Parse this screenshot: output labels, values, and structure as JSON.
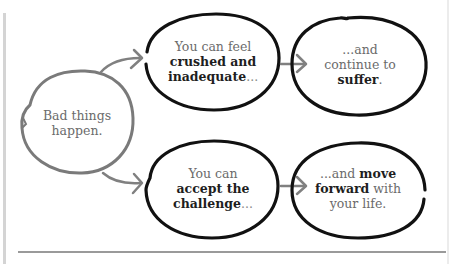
{
  "diagram": {
    "colors": {
      "start_stroke": "#7a7a7a",
      "node_stroke": "#111111",
      "arrow": "#808080",
      "rule": "#9a9a9a",
      "text_regular": "#6b6b6b",
      "text_bold": "#1e1e1e"
    },
    "start": {
      "line1": "Bad things",
      "line2": "happen."
    },
    "top_middle": {
      "line1": "You can feel",
      "bold1": "crushed and",
      "bold2": "inadequate",
      "suffix": "..."
    },
    "top_right": {
      "line1": "...and",
      "line2": "continue to",
      "bold": "suffer",
      "suffix": "."
    },
    "bottom_middle": {
      "line1": "You can",
      "bold1": "accept the",
      "bold2": "challenge",
      "suffix": "..."
    },
    "bottom_right": {
      "prefix": "...and ",
      "bold1": "move",
      "bold2": "forward",
      "after": " with",
      "line3": "your life."
    },
    "edges": [
      {
        "from": "start",
        "to": "top_middle"
      },
      {
        "from": "start",
        "to": "bottom_middle"
      },
      {
        "from": "top_middle",
        "to": "top_right"
      },
      {
        "from": "bottom_middle",
        "to": "bottom_right"
      }
    ]
  }
}
